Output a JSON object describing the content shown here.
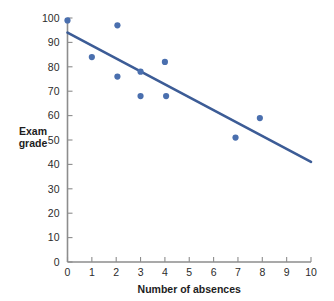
{
  "chart_data": {
    "type": "scatter",
    "title": "",
    "xlabel": "Number of absences",
    "ylabel": "Exam grade",
    "ylabel_lines": [
      "Exam",
      "grade"
    ],
    "xlim": [
      0,
      10
    ],
    "ylim": [
      0,
      100
    ],
    "xticks": [
      0,
      1,
      2,
      3,
      4,
      5,
      6,
      7,
      8,
      9,
      10
    ],
    "xtick_labels": [
      "0",
      "1",
      "2",
      "3",
      "4",
      "5",
      "6",
      "7",
      "8",
      "9",
      "10"
    ],
    "yticks": [
      0,
      10,
      20,
      30,
      40,
      50,
      60,
      70,
      80,
      90,
      100
    ],
    "ytick_labels": [
      "0",
      "10",
      "20",
      "30",
      "40",
      "50",
      "60",
      "70",
      "80",
      "90",
      "100"
    ],
    "grid": false,
    "legend": false,
    "points": [
      {
        "x": 0.0,
        "y": 99
      },
      {
        "x": 1.0,
        "y": 84
      },
      {
        "x": 2.05,
        "y": 97
      },
      {
        "x": 2.05,
        "y": 76
      },
      {
        "x": 3.0,
        "y": 78
      },
      {
        "x": 3.0,
        "y": 68
      },
      {
        "x": 4.0,
        "y": 82
      },
      {
        "x": 4.05,
        "y": 68
      },
      {
        "x": 6.9,
        "y": 51
      },
      {
        "x": 7.9,
        "y": 59
      }
    ],
    "point_color": "#4a6fae",
    "point_size": 3.1,
    "trend_line": {
      "name": "least-squares regression line",
      "x_start": 0.0,
      "y_start": 94,
      "x_end": 10.0,
      "y_end": 41,
      "color": "#3c5c96",
      "width": 2.6
    },
    "axis_color": "#8d8d8d"
  }
}
